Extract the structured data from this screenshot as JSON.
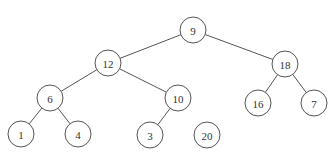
{
  "figure": {
    "title": "",
    "title_clipped": true
  },
  "tree": {
    "node_radius": 13,
    "nodes": [
      {
        "id": "n9",
        "label": "9",
        "x": 193,
        "y": 30,
        "style": "hatched"
      },
      {
        "id": "n12",
        "label": "12",
        "x": 108,
        "y": 63,
        "style": "plain"
      },
      {
        "id": "n18",
        "label": "18",
        "x": 285,
        "y": 64,
        "style": "plain"
      },
      {
        "id": "n6",
        "label": "6",
        "x": 50,
        "y": 98,
        "style": "plain"
      },
      {
        "id": "n10",
        "label": "10",
        "x": 178,
        "y": 98,
        "style": "plain"
      },
      {
        "id": "n16",
        "label": "16",
        "x": 258,
        "y": 103,
        "style": "plain"
      },
      {
        "id": "n7",
        "label": "7",
        "x": 314,
        "y": 103,
        "style": "plain"
      },
      {
        "id": "n1",
        "label": "1",
        "x": 21,
        "y": 134,
        "style": "plain"
      },
      {
        "id": "n4",
        "label": "4",
        "x": 78,
        "y": 134,
        "style": "plain"
      },
      {
        "id": "n3",
        "label": "3",
        "x": 150,
        "y": 135,
        "style": "plain"
      },
      {
        "id": "n20",
        "label": "20",
        "x": 207,
        "y": 135,
        "style": "shaded"
      }
    ],
    "edges": [
      [
        "n9",
        "n12"
      ],
      [
        "n9",
        "n18"
      ],
      [
        "n12",
        "n6"
      ],
      [
        "n12",
        "n10"
      ],
      [
        "n18",
        "n16"
      ],
      [
        "n18",
        "n7"
      ],
      [
        "n6",
        "n1"
      ],
      [
        "n6",
        "n4"
      ],
      [
        "n10",
        "n3"
      ]
    ]
  },
  "colors": {
    "line": "#555555",
    "text": "#333333",
    "shaded_fill": "#d6d6d6",
    "hatch_bg": "#f0f0f0",
    "hatch_line": "#c4c4c4"
  }
}
